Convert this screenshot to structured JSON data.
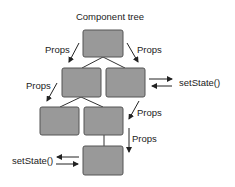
{
  "title": "Component tree",
  "labels": {
    "props_root_left": "Props",
    "props_root_right": "Props",
    "props_level2_left": "Props",
    "props_level3_diag": "Props",
    "props_level3_down": "Props",
    "setstate_right": "setState()",
    "setstate_left": "setState()"
  },
  "colors": {
    "node_fill": "#999999",
    "node_border": "#555555",
    "line": "#333333",
    "text": "#222222"
  },
  "nodes": [
    {
      "id": "root",
      "level": 0
    },
    {
      "id": "child-left",
      "level": 1,
      "parent": "root"
    },
    {
      "id": "child-right",
      "level": 1,
      "parent": "root"
    },
    {
      "id": "grandchild-left",
      "level": 2,
      "parent": "child-left"
    },
    {
      "id": "grandchild-middle",
      "level": 2,
      "parent": "child-left"
    },
    {
      "id": "leaf",
      "level": 3,
      "parent": "grandchild-middle"
    }
  ]
}
